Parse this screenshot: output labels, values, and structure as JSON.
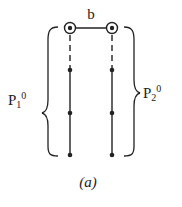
{
  "diagram": {
    "top_label": "b",
    "left_label": {
      "base": "P",
      "sub": "1",
      "sup": "0"
    },
    "right_label": {
      "base": "P",
      "sub": "2",
      "sup": "0"
    },
    "caption": "(a)",
    "ink_color": "#222222",
    "strands": [
      {
        "name": "left",
        "x": 70,
        "top_circle_y": 28,
        "dashed_to": 68,
        "dots_y": [
          70,
          113,
          155
        ]
      },
      {
        "name": "right",
        "x": 112,
        "top_circle_y": 28,
        "dashed_to": 68,
        "dots_y": [
          70,
          113,
          155
        ]
      }
    ]
  }
}
